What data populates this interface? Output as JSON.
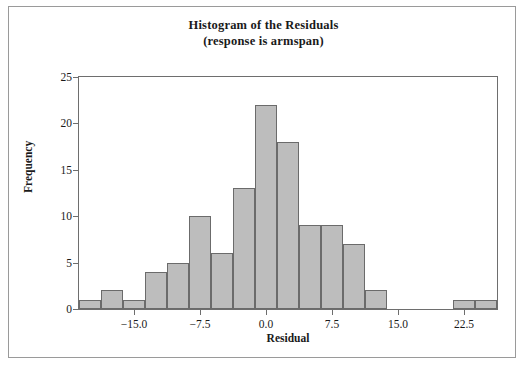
{
  "figure": {
    "title_main": "Histogram of the Residuals",
    "title_sub": "(response is armspan)",
    "frame_color": "#9a9a9a",
    "axis_color": "#6e6e6e"
  },
  "chart_data": {
    "type": "bar",
    "title": "Histogram of the Residuals",
    "subtitle": "(response is armspan)",
    "xlabel": "Residual",
    "ylabel": "Frequency",
    "xlim": [
      -21.25,
      26.25
    ],
    "ylim": [
      0,
      25
    ],
    "xticks": [
      -15.0,
      -7.5,
      0.0,
      7.5,
      15.0,
      22.5
    ],
    "xticklabels": [
      "-15.0",
      "-7.5",
      "0.0",
      "7.5",
      "15.0",
      "22.5"
    ],
    "yticks": [
      0,
      5,
      10,
      15,
      20,
      25
    ],
    "yticklabels": [
      "0",
      "5",
      "10",
      "15",
      "20",
      "25"
    ],
    "grid": false,
    "legend": false,
    "bin_width": 2.5,
    "bar_color": "#bdbdbd",
    "bar_edge_color": "#6b6b6b",
    "bin_left_edges": [
      -21.25,
      -18.75,
      -16.25,
      -13.75,
      -11.25,
      -8.75,
      -6.25,
      -3.75,
      -1.25,
      1.25,
      3.75,
      6.25,
      8.75,
      11.25,
      13.75,
      16.25,
      18.75,
      21.25,
      23.75
    ],
    "bin_centers": [
      -20.0,
      -17.5,
      -15.0,
      -12.5,
      -10.0,
      -7.5,
      -5.0,
      -2.5,
      0.0,
      2.5,
      5.0,
      7.5,
      10.0,
      12.5,
      15.0,
      17.5,
      20.0,
      22.5,
      25.0
    ],
    "values": [
      1,
      2,
      1,
      4,
      5,
      10,
      6,
      13,
      22,
      18,
      9,
      9,
      7,
      2,
      0,
      0,
      0,
      1,
      1
    ]
  }
}
